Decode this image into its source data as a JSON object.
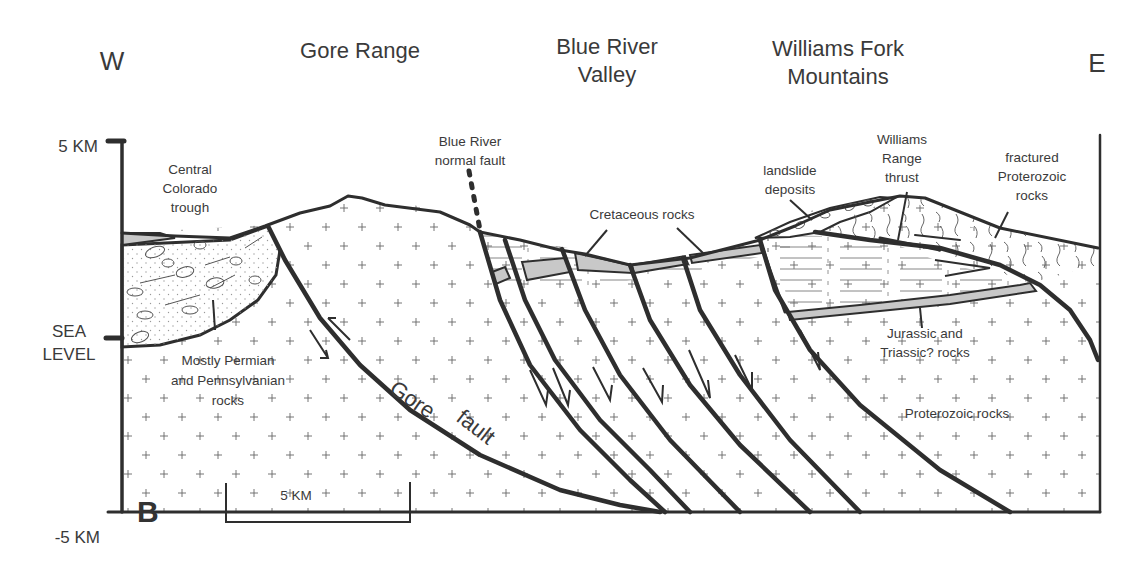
{
  "figure": {
    "panel_letter": "B",
    "directions": {
      "west": "W",
      "east": "E"
    },
    "regions": [
      {
        "label": "Gore Range"
      },
      {
        "label_line1": "Blue River",
        "label_line2": "Valley"
      },
      {
        "label_line1": "Williams Fork",
        "label_line2": "Mountains"
      }
    ],
    "elevation_axis": {
      "top": "5 KM",
      "middle_line1": "SEA",
      "middle_line2": "LEVEL",
      "bottom": "-5 KM"
    },
    "scale_bar": {
      "label": "5 KM"
    },
    "annotations": {
      "central_trough": [
        "Central",
        "Colorado",
        "trough"
      ],
      "blue_river_fault": [
        "Blue River",
        "normal fault"
      ],
      "cretaceous": "Cretaceous rocks",
      "landslide": [
        "landslide",
        "deposits"
      ],
      "williams_thrust": [
        "Williams",
        "Range",
        "thrust"
      ],
      "fractured": [
        "fractured",
        "Proterozoic",
        "rocks"
      ],
      "permian": [
        "Mostly Permian",
        "and Pennsylvanian",
        "rocks"
      ],
      "jurassic": [
        "Jurassic and",
        "Triassic? rocks"
      ],
      "proterozoic": "Proterozoic rocks",
      "gore_fault": [
        "Gore",
        "fault"
      ]
    },
    "colors": {
      "line": "#2e2e2e",
      "text": "#3a3a3a",
      "stripe_fill": "#c8c8c8",
      "background": "#ffffff"
    }
  }
}
